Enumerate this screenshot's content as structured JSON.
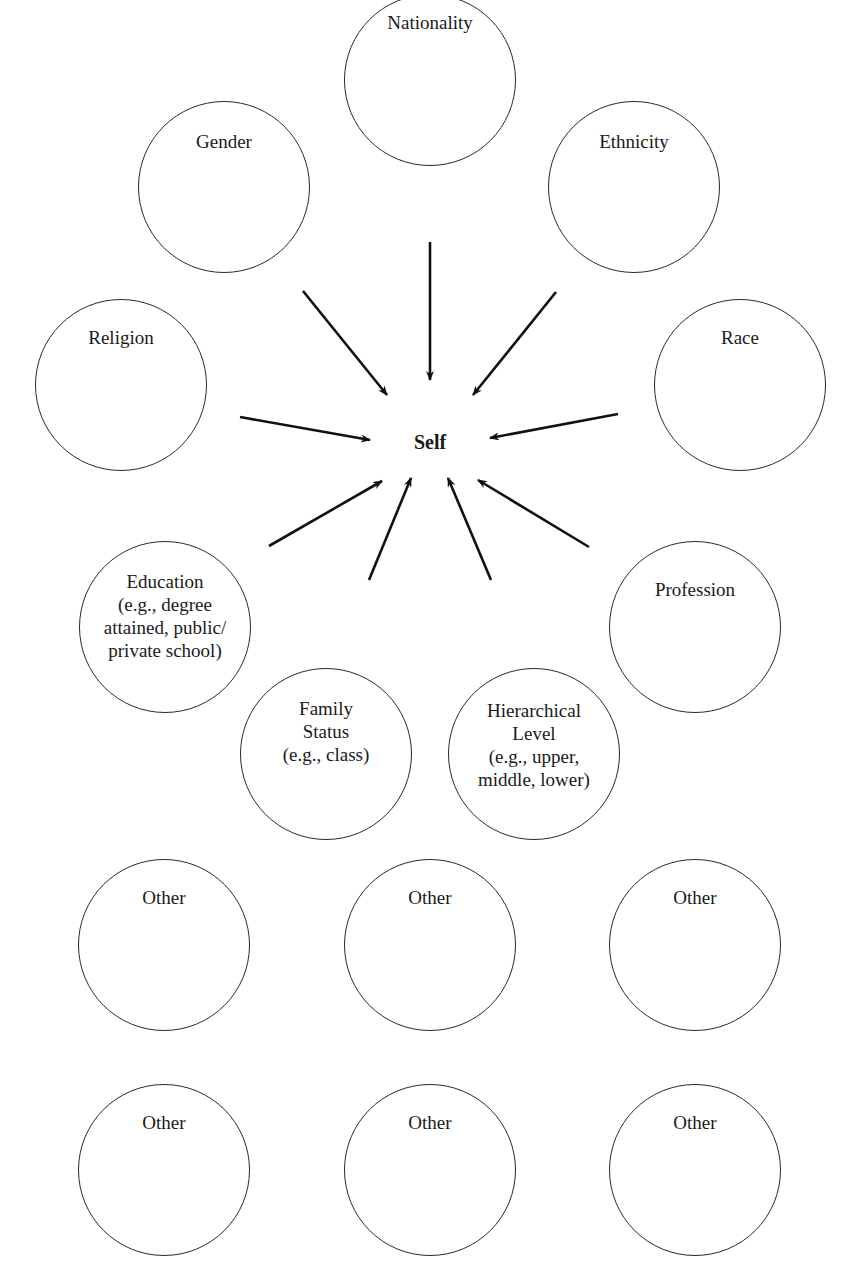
{
  "diagram": {
    "center": {
      "label": "Self",
      "x": 430,
      "y": 443
    },
    "influences": [
      {
        "id": "nationality",
        "label": "Nationality",
        "cx": 430,
        "cy": 80,
        "r": 86,
        "label_top": 16,
        "arrow": {
          "x1": 430,
          "y1": 242,
          "x2": 430,
          "y2": 380
        }
      },
      {
        "id": "gender",
        "label": "Gender",
        "cx": 224,
        "cy": 187,
        "r": 86,
        "label_top": 28,
        "arrow": {
          "x1": 303,
          "y1": 291,
          "x2": 387,
          "y2": 395
        }
      },
      {
        "id": "ethnicity",
        "label": "Ethnicity",
        "cx": 634,
        "cy": 187,
        "r": 86,
        "label_top": 28,
        "arrow": {
          "x1": 556,
          "y1": 292,
          "x2": 473,
          "y2": 395
        }
      },
      {
        "id": "religion",
        "label": "Religion",
        "cx": 121,
        "cy": 385,
        "r": 86,
        "label_top": 26,
        "arrow": {
          "x1": 240,
          "y1": 417,
          "x2": 370,
          "y2": 440
        }
      },
      {
        "id": "race",
        "label": "Race",
        "cx": 740,
        "cy": 385,
        "r": 86,
        "label_top": 26,
        "arrow": {
          "x1": 618,
          "y1": 414,
          "x2": 490,
          "y2": 438
        }
      },
      {
        "id": "education",
        "label": "Education\n(e.g., degree\nattained, public/\nprivate school)",
        "cx": 165,
        "cy": 627,
        "r": 86,
        "label_top": 28,
        "arrow": {
          "x1": 269,
          "y1": 546,
          "x2": 382,
          "y2": 481
        }
      },
      {
        "id": "profession",
        "label": "Profession",
        "cx": 695,
        "cy": 627,
        "r": 86,
        "label_top": 36,
        "arrow": {
          "x1": 589,
          "y1": 547,
          "x2": 478,
          "y2": 480
        }
      },
      {
        "id": "family-status",
        "label": "Family\nStatus\n(e.g., class)",
        "cx": 326,
        "cy": 754,
        "r": 86,
        "label_top": 28,
        "arrow": {
          "x1": 369,
          "y1": 580,
          "x2": 411,
          "y2": 478
        }
      },
      {
        "id": "hierarchical-level",
        "label": "Hierarchical\nLevel\n(e.g., upper,\nmiddle, lower)",
        "cx": 534,
        "cy": 754,
        "r": 86,
        "label_top": 30,
        "arrow": {
          "x1": 491,
          "y1": 580,
          "x2": 448,
          "y2": 478
        }
      }
    ],
    "others": [
      {
        "id": "other-1",
        "label": "Other",
        "cx": 164,
        "cy": 945,
        "r": 86,
        "label_top": 26
      },
      {
        "id": "other-2",
        "label": "Other",
        "cx": 430,
        "cy": 945,
        "r": 86,
        "label_top": 26
      },
      {
        "id": "other-3",
        "label": "Other",
        "cx": 695,
        "cy": 945,
        "r": 86,
        "label_top": 26
      },
      {
        "id": "other-4",
        "label": "Other",
        "cx": 164,
        "cy": 1170,
        "r": 86,
        "label_top": 26
      },
      {
        "id": "other-5",
        "label": "Other",
        "cx": 430,
        "cy": 1170,
        "r": 86,
        "label_top": 26
      },
      {
        "id": "other-6",
        "label": "Other",
        "cx": 695,
        "cy": 1170,
        "r": 86,
        "label_top": 26
      }
    ],
    "colors": {
      "stroke": "#2a2a2a",
      "text": "#1a1a1a",
      "background": "#ffffff"
    }
  }
}
